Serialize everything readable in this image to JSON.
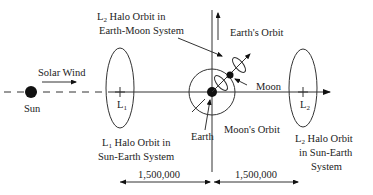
{
  "diagram": {
    "labels": {
      "sun": "Sun",
      "solar_wind": "Solar Wind",
      "l1_point": "L",
      "l1_sub": "1",
      "l2_point": "L",
      "l2_sub": "2",
      "earth": "Earth",
      "moon": "Moon",
      "earths_orbit": "Earth's Orbit",
      "moons_orbit": "Moon's Orbit",
      "l2_em_line1_prefix": "L",
      "l2_em_line1_sub": "2",
      "l2_em_line1_rest": " Halo Orbit in",
      "l2_em_line2": "Earth-Moon System",
      "l1_se_line1_prefix": "L",
      "l1_se_line1_sub": "1",
      "l1_se_line1_rest": " Halo Orbit in",
      "l1_se_line2": "Sun-Earth System",
      "l2_se_line1_prefix": "L",
      "l2_se_line1_sub": "2",
      "l2_se_line1_rest": " Halo Orbit",
      "l2_se_line2": "in Sun-Earth",
      "l2_se_line3": "System"
    },
    "distances": {
      "left": "1,500,000",
      "right": "1,500,000"
    },
    "colors": {
      "ink": "#222222",
      "background": "#ffffff"
    }
  }
}
